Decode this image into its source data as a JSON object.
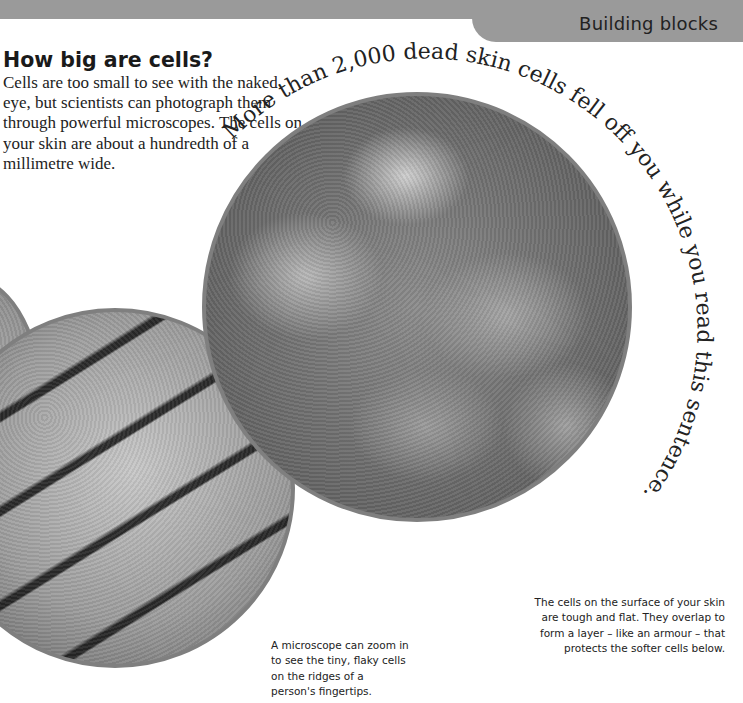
{
  "header": {
    "section_title": "Building blocks",
    "band_color": "#9a9a9a"
  },
  "intro": {
    "heading": "How big are cells?",
    "body": "Cells are too small to see with the naked eye, but scientists can photograph them through powerful microscopes. The cells on your skin are about a hundredth of a millimetre wide."
  },
  "arc_caption": "More than 2,000 dead skin cells fell off you while you read this sentence.",
  "images": {
    "left_partial": "partial-microscope-image",
    "fingertip": "fingertip-ridges-micrograph",
    "skin_surface": "skin-surface-cells-micrograph"
  },
  "captions": {
    "fingertip": "A microscope can zoom in to see the tiny, flaky cells on the ridges of a person's fingertips.",
    "skin_surface": "The cells on the surface of your skin are tough and flat. They overlap to form a layer – like an armour – that protects the softer cells below."
  }
}
